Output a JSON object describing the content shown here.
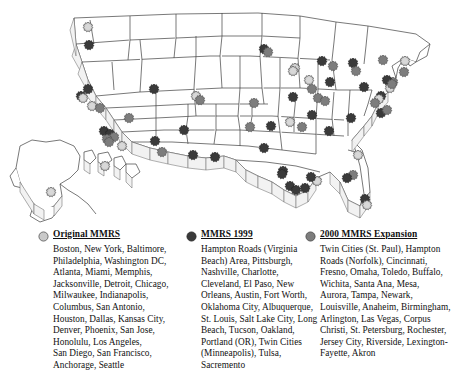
{
  "map": {
    "title": "Metropolitan Medical Response System (MMRS) cities map of the United States",
    "description": "Shaded relief style outline map of the United States with Alaska and Hawaii insets, showing MMRS city locations as circular starburst markers.",
    "marker_shape": "starburst-circle",
    "insets": [
      "Alaska",
      "Hawaii"
    ],
    "colors": {
      "original": "#c9c9c9",
      "mmrs_1999": "#3a3a3a",
      "expansion_2000": "#7d7d7d",
      "outline": "#3f3f3f",
      "marker_stroke": "#555555",
      "background": "#ffffff"
    },
    "markers": [
      {
        "name": "Seattle",
        "x": 88,
        "y": 27,
        "cat": "original"
      },
      {
        "name": "Portland (OR)",
        "x": 89,
        "y": 45,
        "cat": "mmrs_1999"
      },
      {
        "name": "Sacramento",
        "x": 88,
        "y": 89,
        "cat": "mmrs_1999"
      },
      {
        "name": "Oakland",
        "x": 81,
        "y": 96,
        "cat": "mmrs_1999"
      },
      {
        "name": "San Francisco",
        "x": 83,
        "y": 98,
        "cat": "original"
      },
      {
        "name": "San Jose",
        "x": 92,
        "y": 106,
        "cat": "original"
      },
      {
        "name": "Fresno",
        "x": 100,
        "y": 108,
        "cat": "expansion_2000"
      },
      {
        "name": "Las Vegas",
        "x": 129,
        "y": 118,
        "cat": "expansion_2000"
      },
      {
        "name": "Los Angeles",
        "x": 104,
        "y": 131,
        "cat": "mmrs_1999"
      },
      {
        "name": "Long Beach",
        "x": 110,
        "y": 134,
        "cat": "mmrs_1999"
      },
      {
        "name": "Riverside",
        "x": 114,
        "y": 137,
        "cat": "expansion_2000"
      },
      {
        "name": "Anaheim",
        "x": 107,
        "y": 139,
        "cat": "expansion_2000"
      },
      {
        "name": "Santa Ana",
        "x": 109,
        "y": 142,
        "cat": "expansion_2000"
      },
      {
        "name": "San Diego",
        "x": 122,
        "y": 146,
        "cat": "original"
      },
      {
        "name": "Salt Lake City",
        "x": 154,
        "y": 89,
        "cat": "mmrs_1999"
      },
      {
        "name": "Denver",
        "x": 196,
        "y": 96,
        "cat": "original"
      },
      {
        "name": "Aurora",
        "x": 200,
        "y": 100,
        "cat": "expansion_2000"
      },
      {
        "name": "Phoenix",
        "x": 155,
        "y": 141,
        "cat": "mmrs_1999"
      },
      {
        "name": "Mesa",
        "x": 162,
        "y": 152,
        "cat": "expansion_2000"
      },
      {
        "name": "Tucson",
        "x": 184,
        "y": 130,
        "cat": "mmrs_1999"
      },
      {
        "name": "Albuquerque",
        "x": 193,
        "y": 155,
        "cat": "mmrs_1999"
      },
      {
        "name": "El Paso",
        "x": 215,
        "y": 157,
        "cat": "mmrs_1999"
      },
      {
        "name": "Honolulu",
        "x": 105,
        "y": 166,
        "cat": "original"
      },
      {
        "name": "Anchorage",
        "x": 51,
        "y": 192,
        "cat": "original"
      },
      {
        "name": "Minneapolis (Twin Cities)",
        "x": 264,
        "y": 49,
        "cat": "mmrs_1999"
      },
      {
        "name": "St. Paul (Twin Cities)",
        "x": 268,
        "y": 52,
        "cat": "expansion_2000"
      },
      {
        "name": "Omaha",
        "x": 254,
        "y": 103,
        "cat": "expansion_2000"
      },
      {
        "name": "Wichita",
        "x": 250,
        "y": 127,
        "cat": "expansion_2000"
      },
      {
        "name": "Kansas City",
        "x": 271,
        "y": 126,
        "cat": "mmrs_1999"
      },
      {
        "name": "Tulsa",
        "x": 264,
        "y": 148,
        "cat": "mmrs_1999"
      },
      {
        "name": "Oklahoma City",
        "x": 283,
        "y": 171,
        "cat": "mmrs_1999"
      },
      {
        "name": "Dallas",
        "x": 282,
        "y": 174,
        "cat": "mmrs_1999"
      },
      {
        "name": "Fort Worth",
        "x": 290,
        "y": 186,
        "cat": "mmrs_1999"
      },
      {
        "name": "Austin",
        "x": 296,
        "y": 190,
        "cat": "mmrs_1999"
      },
      {
        "name": "San Antonio",
        "x": 305,
        "y": 188,
        "cat": "mmrs_1999"
      },
      {
        "name": "Houston",
        "x": 317,
        "y": 181,
        "cat": "original"
      },
      {
        "name": "New Orleans",
        "x": 311,
        "y": 177,
        "cat": "mmrs_1999"
      },
      {
        "name": "Milwaukee",
        "x": 295,
        "y": 68,
        "cat": "original"
      },
      {
        "name": "Chicago",
        "x": 293,
        "y": 71,
        "cat": "original"
      },
      {
        "name": "Detroit",
        "x": 322,
        "y": 61,
        "cat": "mmrs_1999"
      },
      {
        "name": "Toledo",
        "x": 333,
        "y": 66,
        "cat": "expansion_2000"
      },
      {
        "name": "Cleveland",
        "x": 353,
        "y": 63,
        "cat": "mmrs_1999"
      },
      {
        "name": "Buffalo",
        "x": 383,
        "y": 60,
        "cat": "expansion_2000"
      },
      {
        "name": "Rochester",
        "x": 404,
        "y": 72,
        "cat": "expansion_2000"
      },
      {
        "name": "Indianapolis",
        "x": 309,
        "y": 80,
        "cat": "original"
      },
      {
        "name": "Columbus",
        "x": 330,
        "y": 82,
        "cat": "mmrs_1999"
      },
      {
        "name": "Cincinnati",
        "x": 312,
        "y": 89,
        "cat": "expansion_2000"
      },
      {
        "name": "Akron",
        "x": 356,
        "y": 71,
        "cat": "expansion_2000"
      },
      {
        "name": "Pittsburgh",
        "x": 364,
        "y": 87,
        "cat": "mmrs_1999"
      },
      {
        "name": "Philadelphia",
        "x": 390,
        "y": 88,
        "cat": "original"
      },
      {
        "name": "Jersey City",
        "x": 393,
        "y": 82,
        "cat": "expansion_2000"
      },
      {
        "name": "New York",
        "x": 387,
        "y": 80,
        "cat": "mmrs_1999"
      },
      {
        "name": "Newark",
        "x": 392,
        "y": 84,
        "cat": "expansion_2000"
      },
      {
        "name": "Boston",
        "x": 405,
        "y": 61,
        "cat": "original"
      },
      {
        "name": "Baltimore",
        "x": 381,
        "y": 96,
        "cat": "mmrs_1999"
      },
      {
        "name": "Washington DC",
        "x": 379,
        "y": 99,
        "cat": "original"
      },
      {
        "name": "Arlington",
        "x": 375,
        "y": 103,
        "cat": "expansion_2000"
      },
      {
        "name": "Virginia Beach (Hampton Roads)",
        "x": 381,
        "y": 113,
        "cat": "mmrs_1999"
      },
      {
        "name": "Norfolk (Hampton Roads)",
        "x": 387,
        "y": 110,
        "cat": "expansion_2000"
      },
      {
        "name": "St. Louis",
        "x": 293,
        "y": 97,
        "cat": "mmrs_1999"
      },
      {
        "name": "Louisville",
        "x": 318,
        "y": 98,
        "cat": "expansion_2000"
      },
      {
        "name": "Lexington-Fayette",
        "x": 325,
        "y": 101,
        "cat": "expansion_2000"
      },
      {
        "name": "Nashville",
        "x": 312,
        "y": 115,
        "cat": "mmrs_1999"
      },
      {
        "name": "Charlotte",
        "x": 351,
        "y": 118,
        "cat": "mmrs_1999"
      },
      {
        "name": "Memphis",
        "x": 290,
        "y": 122,
        "cat": "original"
      },
      {
        "name": "Birmingham",
        "x": 302,
        "y": 127,
        "cat": "expansion_2000"
      },
      {
        "name": "Atlanta",
        "x": 329,
        "y": 131,
        "cat": "mmrs_1999"
      },
      {
        "name": "Jacksonville",
        "x": 358,
        "y": 155,
        "cat": "original"
      },
      {
        "name": "Tampa",
        "x": 353,
        "y": 175,
        "cat": "expansion_2000"
      },
      {
        "name": "St. Petersburg",
        "x": 347,
        "y": 178,
        "cat": "mmrs_1999"
      },
      {
        "name": "Miami",
        "x": 365,
        "y": 199,
        "cat": "mmrs_1999"
      },
      {
        "name": "Fort Lauderdale",
        "x": 367,
        "y": 205,
        "cat": "original"
      }
    ]
  },
  "legend": {
    "columns": [
      {
        "marker": "original-mmrs-marker",
        "title": "Original MMRS",
        "lines": [
          "Boston, New York, Baltimore,",
          "Philadelphia, Washington DC,",
          "Atlanta, Miami, Memphis,",
          "Jacksonville, Detroit, Chicago,",
          "Milwaukee, Indianapolis,",
          "Columbus, San Antonio,",
          "Houston, Dallas, Kansas City,",
          "Denver, Phoenix, San Jose,",
          "Honolulu, Los Angeles,",
          "San Diego, San Francisco,",
          "Anchorage, Seattle"
        ]
      },
      {
        "marker": "mmrs-1999-marker",
        "title": "MMRS 1999",
        "lines": [
          "Hampton Roads (Virginia",
          "Beach) Area, Pittsburgh,",
          "Nashville, Charlotte,",
          "Cleveland, El Paso, New",
          "Orleans, Austin, Fort Worth,",
          "Oklahoma City, Albuquerque,",
          "St. Louis, Salt Lake City, Long",
          "Beach, Tucson, Oakland,",
          "Portland (OR), Twin Cities",
          "(Minneapolis), Tulsa,",
          "Sacremento"
        ]
      },
      {
        "marker": "expansion-2000-marker",
        "title": "2000 MMRS Expansion",
        "lines": [
          "Twin Cities (St. Paul), Hampton",
          "Roads (Norfolk), Cincinnati,",
          "Fresno, Omaha, Toledo, Buffalo,",
          "Wichita, Santa Ana, Mesa,",
          "Aurora, Tampa, Newark,",
          "Louisville, Anaheim, Birmingham,",
          "Arlington, Las Vegas, Corpus",
          "Christi, St. Petersburg, Rochester,",
          "Jersey City, Riverside, Lexington-",
          "Fayette, Akron"
        ]
      }
    ]
  }
}
